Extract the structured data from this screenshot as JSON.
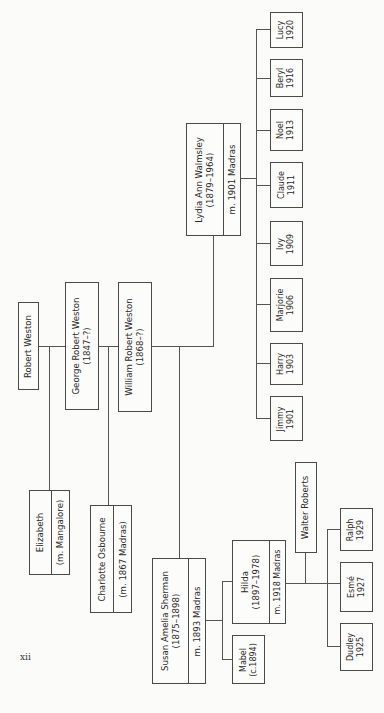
{
  "page": {
    "number": "xii"
  },
  "people": {
    "robert_weston": {
      "name": "Robert Weston"
    },
    "george_robert_weston": {
      "name": "George Robert Weston",
      "dates": "(1847–?)"
    },
    "william_robert_weston": {
      "name": "William Robert Weston",
      "dates": "(1868–?)"
    },
    "lydia_ann_walmsley": {
      "name": "Lydia Ann Walmsley",
      "dates": "(1879–1964)",
      "marriage": "m. 1901 Madras"
    },
    "elizabeth": {
      "name": "Elizabeth",
      "marriage": "(m. Mangalore)"
    },
    "charlotte_osbourne": {
      "name": "Charlotte Osbourne",
      "marriage": "(m. 1867 Madras)"
    },
    "susan_amelia_sherman": {
      "name": "Susan Amelia Sherman",
      "dates": "(1875–1898)",
      "marriage": "m. 1893 Madras"
    },
    "hilda": {
      "name": "Hilda",
      "dates": "(1897–1978)",
      "marriage": "m. 1918 Madras"
    },
    "mabel": {
      "name": "Mabel",
      "dates": "(c.1894)"
    },
    "walter_roberts": {
      "name": "Walter Roberts"
    }
  },
  "lydia_children": [
    {
      "name": "Lucy",
      "year": "1920"
    },
    {
      "name": "Beryl",
      "year": "1916"
    },
    {
      "name": "Noel",
      "year": "1913"
    },
    {
      "name": "Claude",
      "year": "1911"
    },
    {
      "name": "Ivy",
      "year": "1909"
    },
    {
      "name": "Marjorie",
      "year": "1906"
    },
    {
      "name": "Harry",
      "year": "1903"
    },
    {
      "name": "Jimmy",
      "year": "1901"
    }
  ],
  "hilda_children": [
    {
      "name": "Ralph",
      "year": "1929"
    },
    {
      "name": "Esmé",
      "year": "1927"
    },
    {
      "name": "Dudley",
      "year": "1925"
    }
  ]
}
